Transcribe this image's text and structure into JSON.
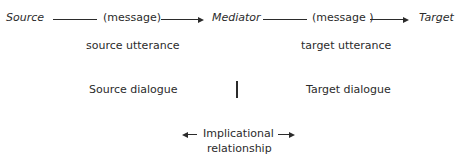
{
  "flow": {
    "source": "Source",
    "message_1": "(message)",
    "mediator": "Mediator",
    "message_2": "(message )",
    "target": "Target"
  },
  "utterances": {
    "source": "source utterance",
    "target": "target utterance"
  },
  "dialogues": {
    "source": "Source dialogue",
    "target": "Target dialogue"
  },
  "relationship": {
    "line1": "Implicational",
    "line2": "relationship"
  }
}
